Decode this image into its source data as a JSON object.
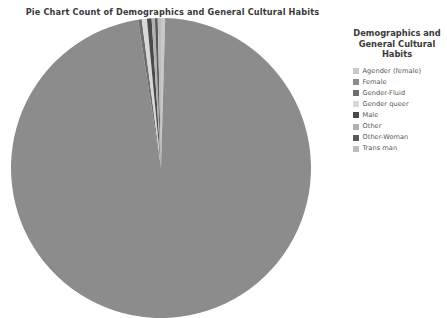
{
  "chart_data": {
    "type": "pie",
    "title": "Pie Chart Count of Demographics and General Cultural Habits",
    "legend_title": "Demographics and General Cultural Habits",
    "legend_position": "right",
    "start_angle_deg": 90,
    "direction": "clockwise",
    "categories": [
      "Agender (female)",
      "Female",
      "Gender-Fluid",
      "Gender queer",
      "Male",
      "Other",
      "Other-Woman",
      "Trans man"
    ],
    "values": [
      0.45,
      97.1,
      0.4,
      0.55,
      0.5,
      0.35,
      0.3,
      0.35
    ],
    "unit": "percent",
    "colors": [
      "#c9c9c9",
      "#8c8c8c",
      "#6e6e6e",
      "#d8d8d8",
      "#4a4a4a",
      "#b0b0b0",
      "#5a5a5a",
      "#bdbdbd"
    ],
    "background_color": "#ffffff",
    "text_color": "#404040",
    "grid": false
  },
  "legend": {
    "title": "Demographics and General Cultural Habits",
    "items": [
      {
        "label": "Agender (female)",
        "color": "#c9c9c9"
      },
      {
        "label": "Female",
        "color": "#8c8c8c"
      },
      {
        "label": "Gender-Fluid",
        "color": "#6e6e6e"
      },
      {
        "label": "Gender queer",
        "color": "#d8d8d8"
      },
      {
        "label": "Male",
        "color": "#4a4a4a"
      },
      {
        "label": "Other",
        "color": "#b0b0b0"
      },
      {
        "label": "Other-Woman",
        "color": "#5a5a5a"
      },
      {
        "label": "Trans man",
        "color": "#bdbdbd"
      }
    ]
  }
}
